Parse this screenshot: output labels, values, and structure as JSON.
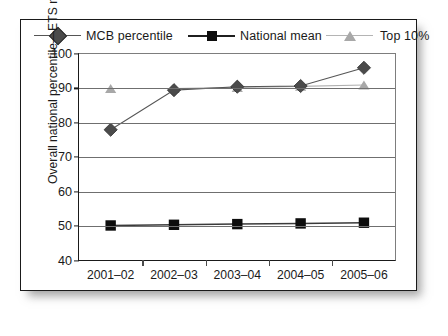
{
  "chart_data": {
    "type": "line",
    "title": "",
    "xlabel": "",
    "ylabel": "Overall national percentile—ETS major field test",
    "categories": [
      "2001–02",
      "2002–03",
      "2003–04",
      "2004–05",
      "2005–06"
    ],
    "ylim": [
      40,
      100
    ],
    "yticks": [
      40,
      50,
      60,
      70,
      80,
      90,
      100
    ],
    "grid": true,
    "legend_position": "top",
    "series": [
      {
        "name": "MCB percentile",
        "marker": "diamond",
        "color": "#4b4b4b",
        "line_color": "#555555",
        "values": [
          78,
          89.5,
          90.5,
          90.7,
          96
        ]
      },
      {
        "name": "National mean",
        "marker": "square",
        "color": "#0d0d0d",
        "line_color": "#3a3a3a",
        "values": [
          50.2,
          50.4,
          50.6,
          50.8,
          51
        ]
      },
      {
        "name": "Top 10%",
        "marker": "triangle",
        "color": "#a8a8a8",
        "line_color": "#b0b0b0",
        "values": [
          90,
          90,
          90.3,
          90.6,
          91
        ]
      }
    ]
  },
  "legend": {
    "items": [
      {
        "label": "MCB percentile",
        "icon": "diamond-marker-icon"
      },
      {
        "label": "National mean",
        "icon": "square-marker-icon"
      },
      {
        "label": "Top 10%",
        "icon": "triangle-marker-icon"
      }
    ]
  },
  "axes": {
    "y_title": "Overall national percentile—ETS major field test",
    "y_tick_labels": [
      "100",
      "90",
      "80",
      "70",
      "60",
      "50",
      "40"
    ],
    "x_tick_labels": [
      "2001–02",
      "2002–03",
      "2003–04",
      "2004–05",
      "2005–06"
    ]
  }
}
